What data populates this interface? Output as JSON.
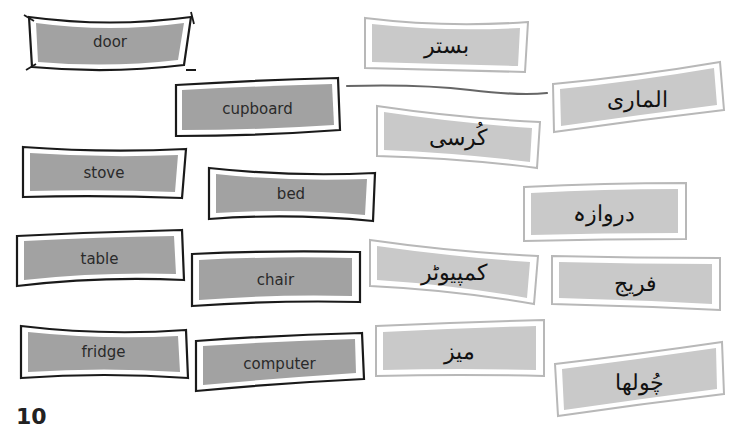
{
  "page_number": "10",
  "colors": {
    "english_fill": "#a2a2a2",
    "english_border": "#1a1a1a",
    "urdu_fill": "#c9c9c9",
    "urdu_border": "#b8b8b8",
    "connector_line": "#666666"
  },
  "english_words": [
    {
      "label": "door"
    },
    {
      "label": "cupboard"
    },
    {
      "label": "stove"
    },
    {
      "label": "bed"
    },
    {
      "label": "table"
    },
    {
      "label": "chair"
    },
    {
      "label": "fridge"
    },
    {
      "label": "computer"
    }
  ],
  "urdu_words": [
    {
      "label": "بستر"
    },
    {
      "label": "الماری"
    },
    {
      "label": "کُرسی"
    },
    {
      "label": "دروازہ"
    },
    {
      "label": "کمپیوٹر"
    },
    {
      "label": "فریج"
    },
    {
      "label": "میز"
    },
    {
      "label": "چُولھا"
    }
  ],
  "matched_pairs": [
    {
      "english": "cupboard",
      "urdu": "الماری"
    }
  ]
}
